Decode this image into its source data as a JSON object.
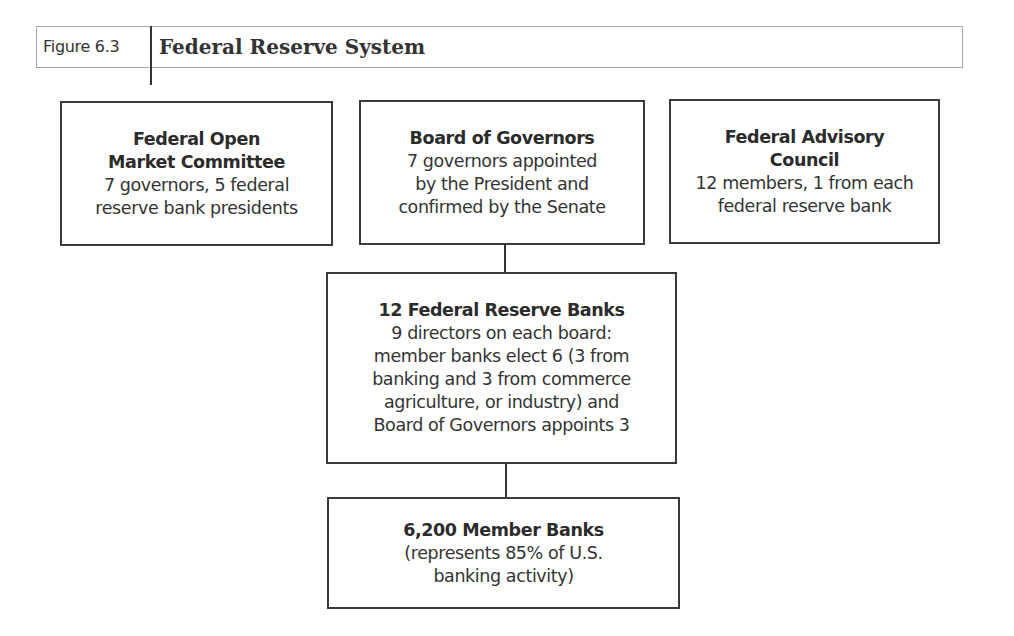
{
  "header": {
    "figure_label": "Figure 6.3",
    "title": "Federal Reserve System"
  },
  "diagram": {
    "type": "org-chart",
    "nodes": [
      {
        "id": "fomc",
        "title_lines": [
          "Federal Open",
          "Market Committee"
        ],
        "desc_lines": [
          "7 governors, 5 federal",
          "reserve bank presidents"
        ]
      },
      {
        "id": "board",
        "title_lines": [
          "Board of Governors"
        ],
        "desc_lines": [
          "7 governors appointed",
          "by the President and",
          "confirmed by the Senate"
        ]
      },
      {
        "id": "fac",
        "title_lines": [
          "Federal Advisory",
          "Council"
        ],
        "desc_lines": [
          "12 members, 1 from each",
          "federal reserve bank"
        ]
      },
      {
        "id": "frb",
        "title_lines": [
          "12 Federal Reserve Banks"
        ],
        "desc_lines": [
          "9 directors on each board:",
          "member banks elect 6 (3 from",
          "banking and 3 from commerce",
          "agriculture, or industry) and",
          "Board of Governors appoints 3"
        ]
      },
      {
        "id": "members",
        "title_lines": [
          "6,200 Member Banks"
        ],
        "desc_lines": [
          "(represents 85% of U.S.",
          "banking activity)"
        ]
      }
    ],
    "edges": [
      {
        "from": "board",
        "to": "frb"
      },
      {
        "from": "frb",
        "to": "members"
      }
    ]
  }
}
